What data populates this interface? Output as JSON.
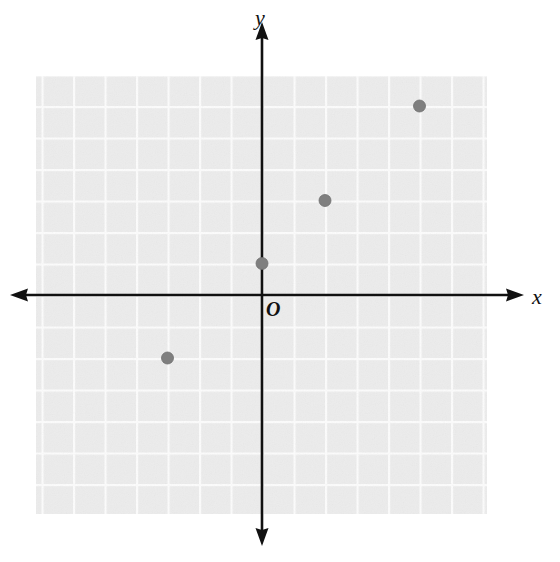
{
  "figure": {
    "kind": "coordinate-plane-scatter",
    "width": 560,
    "height": 562,
    "background_color": "#ffffff"
  },
  "labels": {
    "y_axis": "y",
    "x_axis": "x",
    "origin": "O"
  },
  "colors": {
    "axis": "#111111",
    "grid_cell": "#ededed",
    "grid_line": "#fbfbfb",
    "point_fill": "#7f7f7f",
    "point_stroke": "#6e6e6e"
  },
  "chart_data": {
    "type": "scatter",
    "title": "",
    "xlabel": "x",
    "ylabel": "y",
    "origin_label": "O",
    "grid": true,
    "grid_step": 1,
    "axis_arrows": [
      "left",
      "right",
      "up",
      "down"
    ],
    "tick_labels_shown": false,
    "xlim": [
      -7.2,
      7.2
    ],
    "ylim": [
      -8.0,
      7.0
    ],
    "grid_extent": {
      "x_min": -7.2,
      "x_max": 7.2,
      "y_min": -7.0,
      "y_max": 7.0
    },
    "points": [
      {
        "label": "",
        "x": 0,
        "y": 1
      },
      {
        "label": "",
        "x": 2,
        "y": 3
      },
      {
        "label": "",
        "x": 5,
        "y": 6
      },
      {
        "label": "",
        "x": -3,
        "y": -2
      }
    ],
    "series": [
      {
        "name": "plotted points",
        "marker": "filled-circle",
        "marker_radius_px": 6,
        "values": [
          [
            0,
            1
          ],
          [
            2,
            3
          ],
          [
            5,
            6
          ],
          [
            -3,
            -2
          ]
        ]
      }
    ]
  },
  "geometry": {
    "origin_px": {
      "x": 262,
      "y": 295
    },
    "cell_px": 31.5,
    "grid_rect_px": {
      "x": 36,
      "y": 76,
      "width": 451,
      "height": 438
    },
    "x_axis_px": {
      "x1": 10,
      "x2": 524,
      "y": 295
    },
    "y_axis_px": {
      "y1": 22,
      "y2": 546,
      "x": 262
    }
  }
}
